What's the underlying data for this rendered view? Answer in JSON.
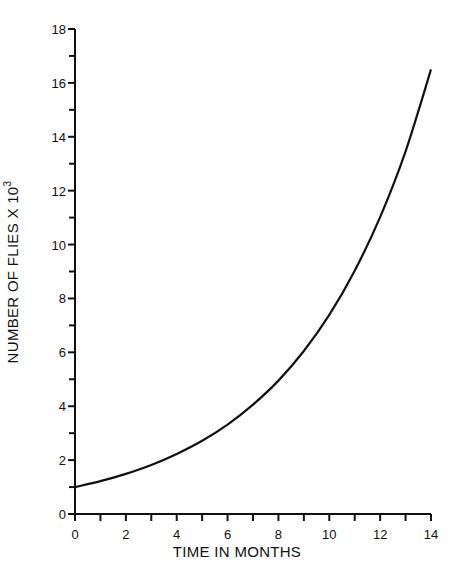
{
  "chart_data": {
    "type": "line",
    "title": "",
    "xlabel": "TIME IN MONTHS",
    "ylabel": "NUMBER OF FLIES X 10",
    "ylabel_superscript": "3",
    "xlim": [
      0,
      14
    ],
    "ylim": [
      0,
      18
    ],
    "x_ticks_major": [
      0,
      2,
      4,
      6,
      8,
      10,
      12,
      14
    ],
    "x_ticks_minor": [
      1,
      3,
      5,
      7,
      9,
      11,
      13
    ],
    "y_ticks_major": [
      0,
      2,
      4,
      6,
      8,
      10,
      12,
      14,
      16,
      18
    ],
    "y_ticks_minor": [
      1,
      3,
      5,
      7,
      9,
      11,
      13,
      15,
      17
    ],
    "grid": false,
    "legend": null,
    "series": [
      {
        "name": "flies",
        "x": [
          0,
          1,
          2,
          3,
          4,
          5,
          6,
          7,
          8,
          9,
          10,
          11,
          12,
          13,
          14
        ],
        "y": [
          1.0,
          1.22,
          1.49,
          1.82,
          2.23,
          2.72,
          3.32,
          4.06,
          4.95,
          6.05,
          7.39,
          9.03,
          11.02,
          13.46,
          16.5
        ]
      }
    ],
    "color": "#111111"
  }
}
